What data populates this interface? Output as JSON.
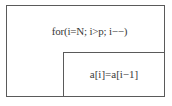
{
  "diagram": {
    "type": "nassi-shneiderman",
    "loop": {
      "header": "for(i=N; i>p; i−−)",
      "body": [
        {
          "statement": "a[i]=a[i−1]"
        }
      ]
    },
    "colors": {
      "border": "#5a5a5a",
      "text": "#3a3a3a",
      "background": "#ffffff"
    }
  }
}
